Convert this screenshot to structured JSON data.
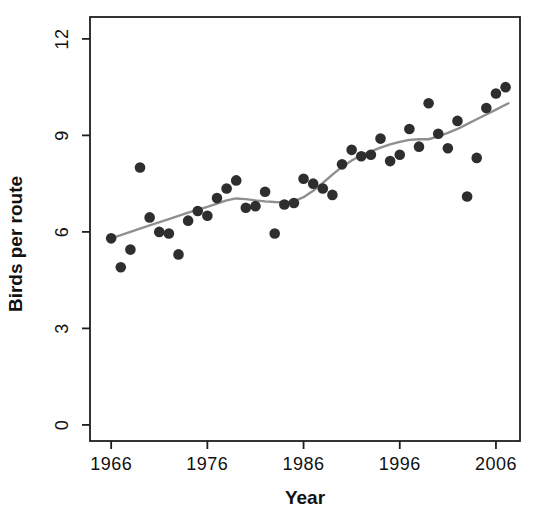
{
  "chart_data": {
    "type": "scatter",
    "title": "",
    "xlabel": "Year",
    "ylabel": "Birds per route",
    "x_ticks": [
      "1966",
      "1976",
      "1986",
      "1996",
      "2006"
    ],
    "x_tick_values": [
      1966,
      1976,
      1986,
      1996,
      2006
    ],
    "y_ticks": [
      "0",
      "3",
      "6",
      "9",
      "12"
    ],
    "y_tick_values": [
      0,
      3,
      6,
      9,
      12
    ],
    "xlim": [
      1963.8,
      2008.5
    ],
    "ylim": [
      -0.5,
      12.68
    ],
    "grid": false,
    "legend_position": "none",
    "series": [
      {
        "name": "annual-bird-counts",
        "type": "scatter",
        "x": [
          1966,
          1967,
          1968,
          1969,
          1970,
          1971,
          1972,
          1973,
          1974,
          1975,
          1976,
          1977,
          1978,
          1979,
          1980,
          1981,
          1982,
          1983,
          1984,
          1985,
          1986,
          1987,
          1988,
          1989,
          1990,
          1991,
          1992,
          1993,
          1994,
          1995,
          1996,
          1997,
          1998,
          1999,
          2000,
          2001,
          2002,
          2003,
          2004,
          2005,
          2006,
          2007
        ],
        "y": [
          5.8,
          4.9,
          5.45,
          8.0,
          6.45,
          6.0,
          5.95,
          5.3,
          6.35,
          6.65,
          6.5,
          7.05,
          7.35,
          7.6,
          6.75,
          6.8,
          7.25,
          5.95,
          6.85,
          6.9,
          7.65,
          7.5,
          7.35,
          7.15,
          8.1,
          8.55,
          8.35,
          8.4,
          8.9,
          8.2,
          8.4,
          9.2,
          8.65,
          10.0,
          9.05,
          8.6,
          9.45,
          7.1,
          8.3,
          9.85,
          10.3,
          10.5
        ]
      },
      {
        "name": "smoothed-trend",
        "type": "line",
        "x": [
          1966,
          1968,
          1970,
          1972,
          1974,
          1976,
          1978,
          1979,
          1980,
          1981,
          1982,
          1983,
          1984,
          1985,
          1986,
          1987,
          1988,
          1989,
          1990,
          1991,
          1992,
          1993,
          1994,
          1995,
          1996,
          1997,
          1998,
          1999,
          2000,
          2001,
          2002,
          2003,
          2004,
          2005,
          2006,
          2007.3
        ],
        "y": [
          5.8,
          6.0,
          6.2,
          6.4,
          6.6,
          6.78,
          6.98,
          7.04,
          7.02,
          6.98,
          6.95,
          6.93,
          6.92,
          6.95,
          7.08,
          7.28,
          7.52,
          7.78,
          8.02,
          8.22,
          8.38,
          8.5,
          8.62,
          8.72,
          8.8,
          8.86,
          8.88,
          8.88,
          8.97,
          9.08,
          9.2,
          9.35,
          9.5,
          9.65,
          9.8,
          10.0
        ]
      }
    ],
    "colors": {
      "points": "#2e2e2e",
      "trend_line": "#8f8f8f",
      "frame": "#1f1f1f",
      "text": "#111111",
      "background": "#ffffff"
    },
    "point_radius": 5.3
  }
}
